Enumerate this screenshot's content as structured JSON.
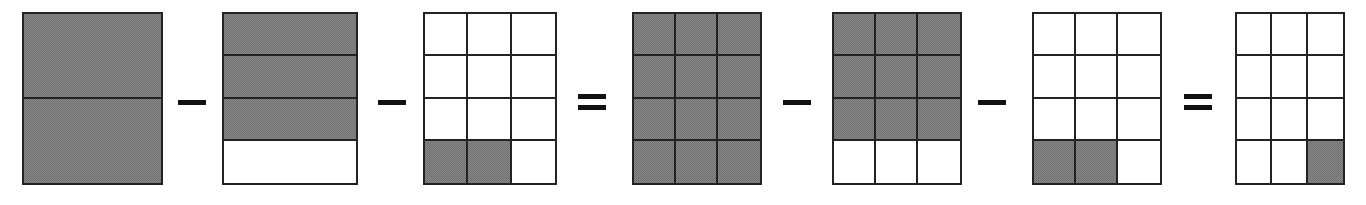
{
  "colors": {
    "shaded_fill": "#808080",
    "line": "#232323",
    "operator": "#111111",
    "background": "#ffffff"
  },
  "chart_data": {
    "type": "table",
    "xlabel": "",
    "ylabel": "",
    "sequence": [
      {
        "kind": "figure",
        "ref": "figures.0"
      },
      {
        "kind": "operator",
        "ref": "operators.0"
      },
      {
        "kind": "figure",
        "ref": "figures.1"
      },
      {
        "kind": "operator",
        "ref": "operators.1"
      },
      {
        "kind": "figure",
        "ref": "figures.2"
      },
      {
        "kind": "operator",
        "ref": "operators.2"
      },
      {
        "kind": "figure",
        "ref": "figures.3"
      },
      {
        "kind": "operator",
        "ref": "operators.3"
      },
      {
        "kind": "figure",
        "ref": "figures.4"
      },
      {
        "kind": "operator",
        "ref": "operators.4"
      },
      {
        "kind": "figure",
        "ref": "figures.5"
      },
      {
        "kind": "operator",
        "ref": "operators.5"
      },
      {
        "kind": "figure",
        "ref": "figures.6"
      }
    ],
    "expression": "1 - 3/4 - 2/12 = 12/12 - 9/12 - 2/12 = 1/12",
    "shaded_counts": [
      2,
      3,
      2,
      12,
      9,
      2,
      1
    ],
    "total_counts": [
      2,
      4,
      12,
      12,
      12,
      12,
      12
    ],
    "fraction_labels": [
      "2/2",
      "3/4",
      "2/12",
      "12/12",
      "9/12",
      "2/12",
      "1/12"
    ]
  },
  "operators": [
    {
      "name": "minus",
      "symbol": "-",
      "bars": 1
    },
    {
      "name": "minus",
      "symbol": "-",
      "bars": 1
    },
    {
      "name": "equals",
      "symbol": "=",
      "bars": 2
    },
    {
      "name": "minus",
      "symbol": "-",
      "bars": 1
    },
    {
      "name": "minus",
      "symbol": "-",
      "bars": 1
    },
    {
      "name": "equals",
      "symbol": "=",
      "bars": 2
    }
  ],
  "figures": [
    {
      "name": "figure-1-whole-halves",
      "cols": 1,
      "rows": 2,
      "x": 22,
      "y": 12,
      "w": 141,
      "h": 173,
      "fraction": "2/2",
      "shaded": 2,
      "total": 2,
      "cells": [
        [
          true
        ],
        [
          true
        ]
      ]
    },
    {
      "name": "figure-2-three-fourths",
      "cols": 1,
      "rows": 4,
      "x": 222,
      "y": 12,
      "w": 136,
      "h": 173,
      "fraction": "3/4",
      "shaded": 3,
      "total": 4,
      "cells": [
        [
          true
        ],
        [
          true
        ],
        [
          true
        ],
        [
          false
        ]
      ]
    },
    {
      "name": "figure-3-two-twelfths",
      "cols": 3,
      "rows": 4,
      "x": 423,
      "y": 12,
      "w": 134,
      "h": 173,
      "fraction": "2/12",
      "shaded": 2,
      "total": 12,
      "cells": [
        [
          false,
          false,
          false
        ],
        [
          false,
          false,
          false
        ],
        [
          false,
          false,
          false
        ],
        [
          true,
          true,
          false
        ]
      ]
    },
    {
      "name": "figure-4-twelve-twelfths",
      "cols": 3,
      "rows": 4,
      "x": 632,
      "y": 12,
      "w": 130,
      "h": 173,
      "fraction": "12/12",
      "shaded": 12,
      "total": 12,
      "cells": [
        [
          true,
          true,
          true
        ],
        [
          true,
          true,
          true
        ],
        [
          true,
          true,
          true
        ],
        [
          true,
          true,
          true
        ]
      ]
    },
    {
      "name": "figure-5-nine-twelfths",
      "cols": 3,
      "rows": 4,
      "x": 832,
      "y": 12,
      "w": 130,
      "h": 173,
      "fraction": "9/12",
      "shaded": 9,
      "total": 12,
      "cells": [
        [
          true,
          true,
          true
        ],
        [
          true,
          true,
          true
        ],
        [
          true,
          true,
          true
        ],
        [
          false,
          false,
          false
        ]
      ]
    },
    {
      "name": "figure-6-two-twelfths",
      "cols": 3,
      "rows": 4,
      "x": 1032,
      "y": 12,
      "w": 130,
      "h": 173,
      "fraction": "2/12",
      "shaded": 2,
      "total": 12,
      "cells": [
        [
          false,
          false,
          false
        ],
        [
          false,
          false,
          false
        ],
        [
          false,
          false,
          false
        ],
        [
          true,
          true,
          false
        ]
      ]
    },
    {
      "name": "figure-7-one-twelfth",
      "cols": 3,
      "rows": 4,
      "x": 1235,
      "y": 12,
      "w": 110,
      "h": 173,
      "fraction": "1/12",
      "shaded": 1,
      "total": 12,
      "cells": [
        [
          false,
          false,
          false
        ],
        [
          false,
          false,
          false
        ],
        [
          false,
          false,
          false
        ],
        [
          false,
          false,
          true
        ]
      ]
    }
  ],
  "operator_positions": [
    {
      "x": 178,
      "y": 84,
      "w": 28,
      "h": 36
    },
    {
      "x": 378,
      "y": 84,
      "w": 28,
      "h": 36
    },
    {
      "x": 578,
      "y": 84,
      "w": 28,
      "h": 36
    },
    {
      "x": 783,
      "y": 84,
      "w": 28,
      "h": 36
    },
    {
      "x": 978,
      "y": 84,
      "w": 28,
      "h": 36
    },
    {
      "x": 1184,
      "y": 84,
      "w": 28,
      "h": 36
    }
  ]
}
